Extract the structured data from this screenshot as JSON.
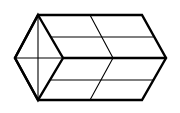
{
  "figure": {
    "stroke_color": "#000000",
    "background": "#ffffff",
    "thick_width": 2.4,
    "thin_width": 1.1,
    "outer_outline": [
      [
        38,
        15
      ],
      [
        142,
        15
      ],
      [
        166,
        58
      ],
      [
        142,
        100
      ],
      [
        38,
        100
      ],
      [
        15,
        58
      ]
    ],
    "left_face": [
      [
        38,
        15
      ],
      [
        63,
        58
      ],
      [
        38,
        100
      ],
      [
        15,
        58
      ]
    ],
    "middle_edge": [
      [
        63,
        58
      ],
      [
        166,
        58
      ]
    ],
    "left_diagonals": [
      [
        [
          38,
          15
        ],
        [
          38,
          100
        ]
      ],
      [
        [
          15,
          58
        ],
        [
          63,
          58
        ]
      ]
    ],
    "inner_horizontals": [
      [
        [
          51,
          37
        ],
        [
          153,
          37
        ]
      ],
      [
        [
          51,
          80
        ],
        [
          153,
          80
        ]
      ]
    ],
    "zigzag": [
      [
        90,
        15
      ],
      [
        113,
        58
      ],
      [
        90,
        100
      ]
    ]
  }
}
